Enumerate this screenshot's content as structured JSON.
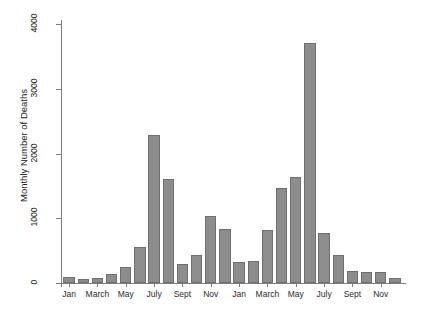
{
  "chart_data": {
    "type": "bar",
    "title": "",
    "subtitle": "",
    "xlabel": "",
    "ylabel": "Monthly Number of Deaths",
    "ylim": [
      0,
      4000
    ],
    "yticks": [
      0,
      1000,
      2000,
      3000,
      4000
    ],
    "ytick_labels": [
      "0",
      "1000",
      "2000",
      "3000",
      "4000"
    ],
    "grid": false,
    "legend": null,
    "bar_color": "#8d8d8d",
    "bar_edge_color": "#6f6f6f",
    "axis_color": "#7d7d7d",
    "categories": [
      "Jan",
      "Feb",
      "March",
      "April",
      "May",
      "June",
      "July",
      "Aug",
      "Sept",
      "Oct",
      "Nov",
      "Dec",
      "Jan",
      "Feb",
      "March",
      "April",
      "May",
      "June",
      "July",
      "Aug",
      "Sept",
      "Oct",
      "Nov",
      "Dec"
    ],
    "xtick_labels": [
      "Jan",
      "March",
      "May",
      "July",
      "Sept",
      "Nov",
      "Jan",
      "March",
      "May",
      "July",
      "Sept",
      "Nov"
    ],
    "xtick_category_index": [
      0,
      2,
      4,
      6,
      8,
      10,
      12,
      14,
      16,
      18,
      20,
      22
    ],
    "values": [
      90,
      60,
      80,
      140,
      250,
      560,
      2290,
      1600,
      290,
      430,
      1030,
      830,
      330,
      340,
      820,
      1460,
      1640,
      3700,
      780,
      430,
      190,
      170,
      170,
      70
    ]
  }
}
